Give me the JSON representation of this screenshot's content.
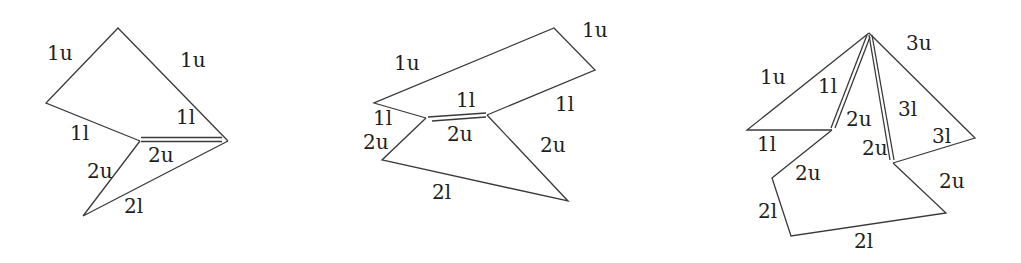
{
  "figure": {
    "panels": [
      {
        "id": "panel-1",
        "labels": [
          {
            "text": "1u",
            "x": 47,
            "y": 60
          },
          {
            "text": "1u",
            "x": 180,
            "y": 67
          },
          {
            "text": "1l",
            "x": 70,
            "y": 140
          },
          {
            "text": "1l",
            "x": 176,
            "y": 124
          },
          {
            "text": "2u",
            "x": 148,
            "y": 162
          },
          {
            "text": "2u",
            "x": 87,
            "y": 178
          },
          {
            "text": "2l",
            "x": 124,
            "y": 213
          }
        ]
      },
      {
        "id": "panel-2",
        "labels": [
          {
            "text": "1u",
            "x": 582,
            "y": 37
          },
          {
            "text": "1u",
            "x": 394,
            "y": 70
          },
          {
            "text": "1l",
            "x": 456,
            "y": 107
          },
          {
            "text": "1l",
            "x": 555,
            "y": 111
          },
          {
            "text": "1l",
            "x": 373,
            "y": 125
          },
          {
            "text": "2u",
            "x": 447,
            "y": 141
          },
          {
            "text": "2u",
            "x": 363,
            "y": 149
          },
          {
            "text": "2u",
            "x": 540,
            "y": 152
          },
          {
            "text": "2l",
            "x": 432,
            "y": 199
          }
        ]
      },
      {
        "id": "panel-3",
        "labels": [
          {
            "text": "3u",
            "x": 906,
            "y": 50
          },
          {
            "text": "1u",
            "x": 760,
            "y": 84
          },
          {
            "text": "1l",
            "x": 818,
            "y": 93
          },
          {
            "text": "2u",
            "x": 846,
            "y": 126
          },
          {
            "text": "3l",
            "x": 898,
            "y": 116
          },
          {
            "text": "1l",
            "x": 757,
            "y": 151
          },
          {
            "text": "3l",
            "x": 932,
            "y": 143
          },
          {
            "text": "2u",
            "x": 862,
            "y": 155
          },
          {
            "text": "2u",
            "x": 795,
            "y": 180
          },
          {
            "text": "2u",
            "x": 939,
            "y": 188
          },
          {
            "text": "2l",
            "x": 758,
            "y": 218
          },
          {
            "text": "2l",
            "x": 854,
            "y": 248
          }
        ]
      }
    ]
  }
}
